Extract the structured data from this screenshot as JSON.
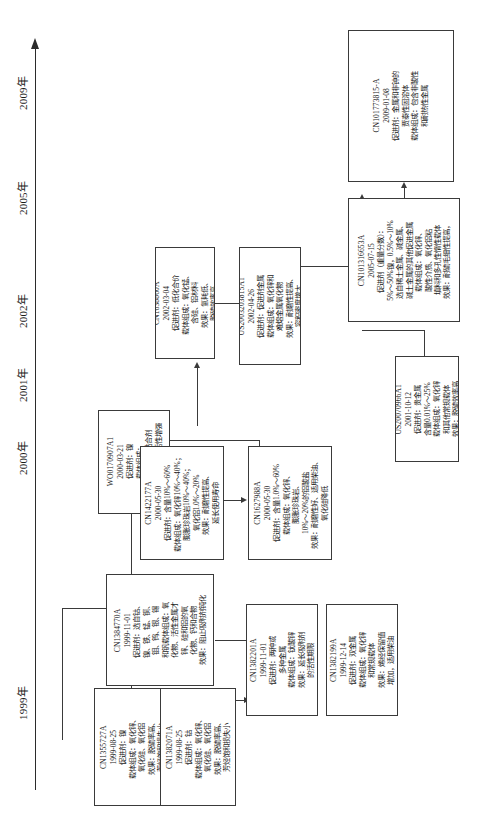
{
  "figure": {
    "type": "technology-roadmap",
    "orientation": "rotated-90-ccw",
    "axis_name": "timeline-axis"
  },
  "timeline": {
    "years": [
      {
        "label": "1999年",
        "top": 700
      },
      {
        "label": "2000年",
        "top": 455
      },
      {
        "label": "2001年",
        "top": 380
      },
      {
        "label": "2002年",
        "top": 305
      },
      {
        "label": "2005年",
        "top": 190
      },
      {
        "label": "2009年",
        "top": 85
      }
    ]
  },
  "nodes": [
    {
      "id": "cn1355727a",
      "lines": [
        "CN1355727A",
        "1999-08-25",
        "促进剂：镍",
        "载体组成：氧化锌、",
        "氧化硅、氧化铝",
        "效果：脱硫率高、",
        "芳烃饱和损失小"
      ]
    },
    {
      "id": "cn1382071a",
      "lines": [
        "CN1382071A",
        "1999-08-25",
        "促进剂：钴",
        "载体组成：氧化锌、",
        "氧化硅、氧化铝",
        "效果：脱硫率高、",
        "芳烃饱和损失小"
      ]
    },
    {
      "id": "cn1384770a",
      "lines": [
        "CN1384770A",
        "1999-11-01",
        "促进剂：选自钴、",
        "镍、铁、锰、铜、",
        "钼、钨、银、锡",
        "和钒载体组成：氧",
        "化物、活性金属才",
        "锌、硅和铝的氧",
        "化物、钙和合物",
        "效果：阻止吸附剂钝化"
      ]
    },
    {
      "id": "cn1382201a",
      "lines": [
        "CN1382201A",
        "1999-11-01",
        "促进剂：两种或",
        "多种金属",
        "载体组成：钛酸锌",
        "效果：延长吸附剂",
        "的活性期限"
      ]
    },
    {
      "id": "cn1382199a",
      "lines": [
        "CN1382199A",
        "1999-12-14",
        "促进剂：双金属",
        "载体组成：氧化锌",
        "和常规载体",
        "效果：烯经保留值",
        "增加，适用柴油"
      ]
    },
    {
      "id": "wo0170907a1",
      "lines": [
        "WO0170907A1",
        "2000-03-21",
        "促进剂：镍",
        "载体组成：",
        "铁酸锌和无机黏合剂",
        "效果：吸附剂的活性增强"
      ]
    },
    {
      "id": "cn1422177a",
      "lines": [
        "CN1422177A",
        "2000-05-30",
        "促进剂：含量10%～60%",
        "载体组成：氧化锌10%～40%；",
        "膨胀珍珠岩10%～40%；",
        "氧化铝1.0%～20%",
        "效果：耐磨性提高、",
        "延长使用寿命"
      ]
    },
    {
      "id": "cn1627988a",
      "lines": [
        "CN1627988A",
        "2000-05-30",
        "促进剂：含量1.0%～60%",
        "载体组成：氧化锌、",
        "膨胀珍珠岩、",
        "10%～20%的铝酸盐",
        "效果：耐磨性好、适用柴油、",
        "氧化硅降低"
      ]
    },
    {
      "id": "cn1638860a",
      "lines": [
        "CN1638860A",
        "2002-03-04",
        "促进剂：低化合价",
        "载体组成：氧化锰、",
        "含硅、铝材料",
        "效果：氢耗低、",
        "脱硫效率高"
      ]
    },
    {
      "id": "us2003203815a1",
      "lines": [
        "US2003203815A1",
        "2002-04-26",
        "促进剂：促进剂金属",
        "载体组成：氧化锌和",
        "难熔金属氧化物",
        "效果：耐磨性提高、",
        "容积密度增大"
      ]
    },
    {
      "id": "us20070966a1",
      "lines": [
        "US20070966A1",
        "2001-10-12",
        "促进剂：贵金属",
        "含量0.01%～25%",
        "载体组成：氧化锌",
        "和其他常规载体",
        "效果：脱硫效率高"
      ]
    },
    {
      "id": "cn101316653a",
      "lines": [
        "CN101316653A",
        "2005-07-15",
        "促进剂（重量分数）：",
        "5%～50%镍，0.5%～10%",
        "选自稀土金属、碱金属、",
        "碱土金属的其他促进金属",
        "载体组成：氧化锌、",
        "酸性介质、氧化铝粘",
        "填料和多孔性惰性载体",
        "效果：耐硫毛细性提高，",
        "脱硫率提高"
      ]
    },
    {
      "id": "cn101773815a",
      "lines": [
        "CN101773815-A",
        "2009-01-08",
        "促进剂：金属和非钟的",
        "贾泰性固溶体",
        "载体组成：包含非酸性",
        "和耐热性金属",
        "效果：耐硫酸盐"
      ]
    }
  ]
}
